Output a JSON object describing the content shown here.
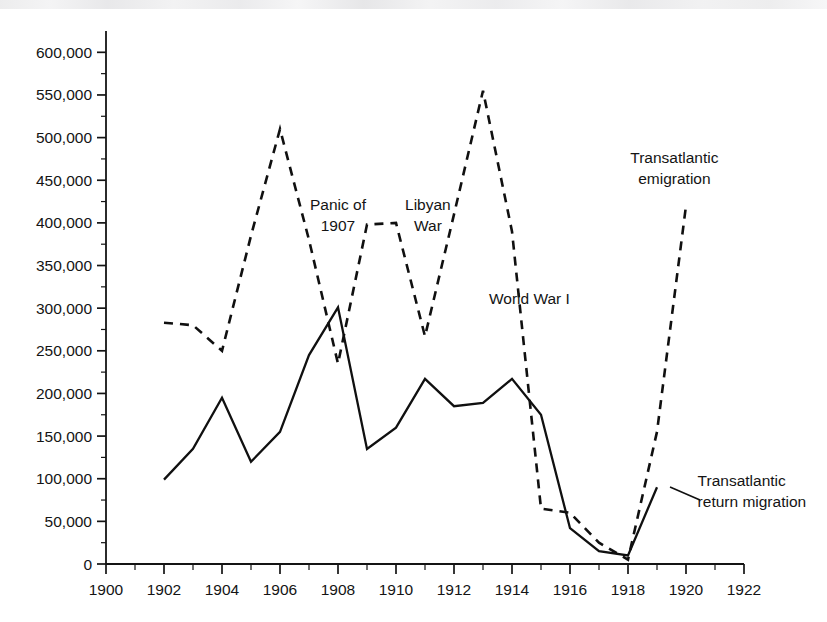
{
  "chart_data": {
    "type": "line",
    "title": "",
    "subtitle": "",
    "xlabel": "",
    "ylabel": "",
    "xlim": [
      1900,
      1922
    ],
    "ylim": [
      0,
      625000
    ],
    "grid": false,
    "legend_position": "inline-annotations",
    "x_ticks": [
      1900,
      1902,
      1904,
      1906,
      1908,
      1910,
      1912,
      1914,
      1916,
      1918,
      1920,
      1922
    ],
    "x_tick_labels": [
      "1900",
      "1902",
      "1904",
      "1906",
      "1908",
      "1910",
      "1912",
      "1914",
      "1916",
      "1918",
      "1920",
      "1922"
    ],
    "x_minor_step": 1,
    "y_ticks": [
      0,
      50000,
      100000,
      150000,
      200000,
      250000,
      300000,
      350000,
      400000,
      450000,
      500000,
      550000,
      600000
    ],
    "y_tick_labels": [
      "0",
      "50,000",
      "100,000",
      "150,000",
      "200,000",
      "250,000",
      "300,000",
      "350,000",
      "400,000",
      "450,000",
      "500,000",
      "550,000",
      "600,000"
    ],
    "y_minor_step": 25000,
    "series": [
      {
        "name": "Transatlantic emigration",
        "style": "dashed",
        "x": [
          1902,
          1903,
          1904,
          1905,
          1906,
          1907,
          1908,
          1909,
          1910,
          1911,
          1912,
          1913,
          1914,
          1915,
          1916,
          1917,
          1918,
          1919,
          1920
        ],
        "values": [
          283000,
          280000,
          250000,
          385000,
          510000,
          380000,
          235000,
          398000,
          400000,
          267000,
          410000,
          555000,
          390000,
          65000,
          60000,
          25000,
          5000,
          155000,
          420000
        ]
      },
      {
        "name": "Transatlantic return migration",
        "style": "solid",
        "x": [
          1902,
          1903,
          1904,
          1905,
          1906,
          1907,
          1908,
          1909,
          1910,
          1911,
          1912,
          1913,
          1914,
          1915,
          1916,
          1917,
          1918,
          1919
        ],
        "values": [
          99000,
          135000,
          195000,
          120000,
          155000,
          245000,
          301000,
          135000,
          160000,
          217000,
          185000,
          189000,
          217000,
          175000,
          42000,
          15000,
          10000,
          90000
        ]
      }
    ],
    "annotations": [
      {
        "text_lines": [
          "Panic of",
          "1907"
        ],
        "x": 1908.0,
        "y": 415000
      },
      {
        "text_lines": [
          "Libyan",
          "War"
        ],
        "x": 1911.1,
        "y": 415000
      },
      {
        "text_lines": [
          "World War I"
        ],
        "x": 1914.6,
        "y": 305000
      },
      {
        "text_lines": [
          "Transatlantic",
          "emigration"
        ],
        "x": 1919.6,
        "y": 470000
      },
      {
        "text_lines": [
          "Transatlantic",
          "return migration"
        ],
        "x": 1920.4,
        "y": 92000
      }
    ]
  },
  "colors": {
    "ink": "#141414",
    "background": "#ffffff",
    "series": "#101010"
  }
}
